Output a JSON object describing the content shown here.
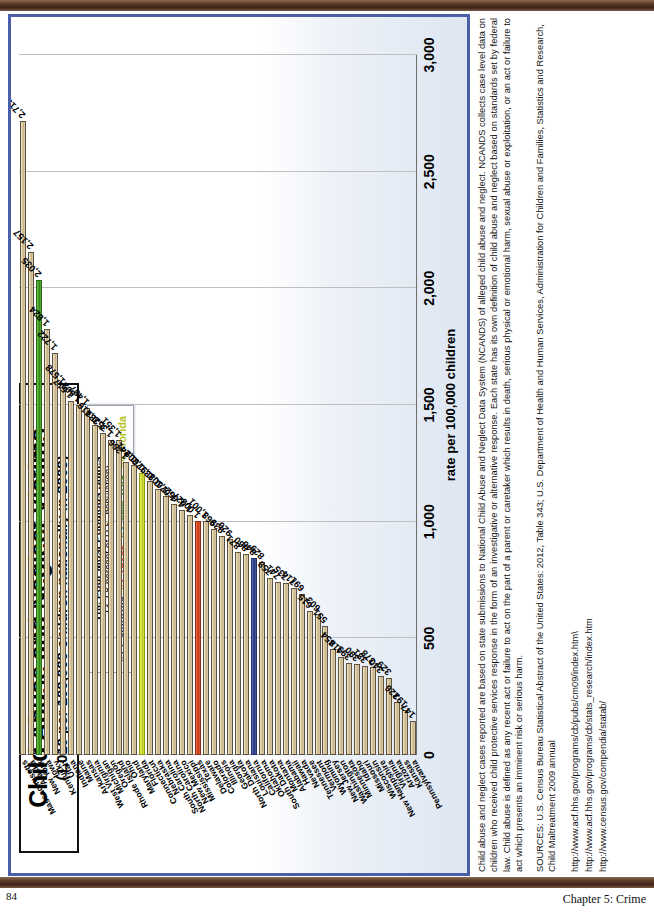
{
  "page": {
    "folio": "84",
    "chapter": "Chapter 5: Crime"
  },
  "chart_panel": {
    "title_main": "Child Abuse and Neglect Victims",
    "title_sub": "(1,010 per 100,000 children nationally in 2009)",
    "legend": {
      "heading": "The Four Most Populous States",
      "subheading": "(3.2.8 percent of U.S. population)",
      "entries": [
        {
          "rank": "#1",
          "state": "California",
          "color": "#2c3f8f"
        },
        {
          "rank": "#2",
          "state": "Texas",
          "color": "#d9441a"
        },
        {
          "rank": "#3",
          "state": "New York",
          "color": "#3f9e20"
        },
        {
          "rank": "#4",
          "state": "Florida",
          "color": "#b4c321"
        }
      ]
    }
  },
  "chart_data": {
    "type": "bar",
    "orientation": "horizontal",
    "title": "Child Abuse and Neglect Victims",
    "subtitle": "(1,010 per 100,000 children nationally in 2009)",
    "xlabel": "",
    "ylabel": "rate per 100,000 children",
    "ylim": [
      0,
      3000
    ],
    "tick_labels": [
      "0",
      "500",
      "1,000",
      "1,500",
      "2,000",
      "2,500",
      "3,000"
    ],
    "tick_values": [
      0,
      500,
      1000,
      1500,
      2000,
      2500,
      3000
    ],
    "grid": true,
    "legend_position": "top-right",
    "categories": [
      "Massachusetts",
      "Alaska",
      "New York",
      "Iowa",
      "Kentucky",
      "Utah",
      "Indiana",
      "Maine",
      "Arkansas",
      "West Virginia",
      "Michigan",
      "Oregon",
      "Rhode Island",
      "Ohio",
      "Maryland",
      "Florida",
      "Connecticut",
      "Nebraska",
      "South Carolina",
      "North Carolina",
      "New Mexico",
      "Mississippi",
      "Texas",
      "Delaware",
      "Colorado",
      "Illinois",
      "Georgia",
      "North Dakota",
      "Louisiana",
      "California",
      "Oklahoma",
      "South Dakota",
      "Montana",
      "Alabama",
      "Hawaii",
      "Nevada",
      "Tennessee",
      "Vermont",
      "Wyoming",
      "New Jersey",
      "Washington",
      "Minnesota",
      "Idaho",
      "Missouri",
      "Wisconsin",
      "New Hampshire",
      "Virginia",
      "Arizona",
      "Kansas",
      "Pennsylvania"
    ],
    "values": [
      2719,
      2157,
      2035,
      1824,
      1722,
      1578,
      1517,
      1502,
      1487,
      1416,
      1381,
      1352,
      1351,
      1256,
      1241,
      1209,
      1176,
      1139,
      1108,
      1076,
      1052,
      1027,
      1003,
      1001,
      968,
      939,
      926,
      871,
      860,
      846,
      829,
      758,
      741,
      735,
      714,
      691,
      615,
      603,
      551,
      454,
      418,
      393,
      390,
      381,
      378,
      340,
      329,
      226,
      193,
      147
    ],
    "value_labels": [
      "2,719",
      "2,157",
      "2,035",
      "1,824",
      "1,722",
      "1,578",
      "1,517",
      "1,502",
      "1,487",
      "1,416",
      "1,381",
      "1,352",
      "1,351",
      "1,256",
      "1,241",
      "1,209",
      "1,176",
      "1,139",
      "1,108",
      "1,076",
      "1,052",
      "1,027",
      "1,003",
      "1,001",
      "968",
      "939",
      "926",
      "871",
      "860",
      "846",
      "829",
      "758",
      "741",
      "735",
      "714",
      "691",
      "615",
      "603",
      "551",
      "454",
      "418",
      "393",
      "390",
      "381",
      "378",
      "340",
      "329",
      "226",
      "193",
      "147"
    ],
    "highlight_colors": {
      "California": "blue",
      "Texas": "red",
      "New York": "green",
      "Florida": "yellow"
    },
    "default_bar_color": "#d9c59b"
  },
  "notes": {
    "paragraph": "Child abuse and neglect cases reported are based on state submissions to National Child Abuse and Neglect Data System (NCANDS) of alleged child abuse and neglect. NCANDS collects case level data on children who received child protective services response in the form of an investigative or alternative response. Each state has its own definition of child abuse and neglect based on standards set by federal law. Child abuse is defined as any recent act or failure to act on the part of a parent or caretaker which results in death, serious physical or emotional harm, sexual abuse or exploitation, or an act or failure to act which presents an imminent risk or serious harm.",
    "sources": "SOURCES: U.S. Census Bureau Statistical Abstract of the United States: 2012, Table 343;  U.S. Department of Health and Human Services, Administration for Children and Families, Statistics and Research, Child Maltreatment 2009 annual",
    "urls": [
      "http://www.acf.hhs.gov/programs/cb/pubs/cm09/index.htm\\",
      "http://www.acf.hhs.gov/programs/cb/stats_research/index.htm",
      "http://www.census.gov/compendia/statab/"
    ]
  }
}
